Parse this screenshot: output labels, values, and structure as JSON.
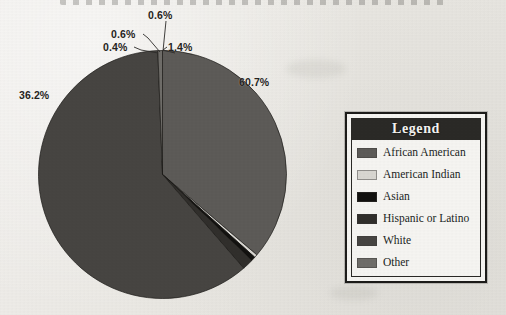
{
  "chart_data": {
    "type": "pie",
    "title": "",
    "categories": [
      "African American",
      "American Indian",
      "Asian",
      "Hispanic or Latino",
      "White",
      "Other"
    ],
    "values": [
      36.2,
      0.4,
      0.6,
      1.4,
      60.7,
      0.6
    ],
    "value_labels": [
      "36.2%",
      "0.4%",
      "0.6%",
      "1.4%",
      "60.7%",
      "0.6%"
    ],
    "unit": "percent",
    "legend_position": "right",
    "legend_title": "Legend",
    "grid": false,
    "colors": [
      "#5d5b58",
      "#d8d6d1",
      "#131210",
      "#312f2c",
      "#474542",
      "#6f6d69"
    ],
    "series": [
      {
        "name": "Race and Ethnicity Distribution",
        "slices": [
          {
            "label": "African American",
            "value": 36.2,
            "display": "36.2%",
            "color": "#5d5b58"
          },
          {
            "label": "American Indian",
            "value": 0.4,
            "display": "0.4%",
            "color": "#d8d6d1"
          },
          {
            "label": "Asian",
            "value": 0.6,
            "display": "0.6%",
            "color": "#131210"
          },
          {
            "label": "Hispanic or Latino",
            "value": 1.4,
            "display": "1.4%",
            "color": "#312f2c"
          },
          {
            "label": "White",
            "value": 60.7,
            "display": "60.7%",
            "color": "#474542"
          },
          {
            "label": "Other",
            "value": 0.6,
            "display": "0.6%",
            "color": "#6f6d69"
          }
        ]
      }
    ]
  },
  "callouts": [
    {
      "id": "c0",
      "text": "0.6%"
    },
    {
      "id": "c1",
      "text": "0.6%"
    },
    {
      "id": "c2",
      "text": "0.4%"
    },
    {
      "id": "c3",
      "text": "1.4%"
    },
    {
      "id": "c4",
      "text": "60.7%"
    },
    {
      "id": "c5",
      "text": "36.2%"
    }
  ],
  "legend": {
    "title": "Legend",
    "items": [
      {
        "label": "African American",
        "color": "#5d5b58"
      },
      {
        "label": "American Indian",
        "color": "#d8d6d1"
      },
      {
        "label": "Asian",
        "color": "#131210"
      },
      {
        "label": "Hispanic or Latino",
        "color": "#312f2c"
      },
      {
        "label": "White",
        "color": "#474542"
      },
      {
        "label": "Other",
        "color": "#6f6d69"
      }
    ]
  },
  "style": {
    "background": "#eceae6",
    "text_color": "#211f1d",
    "legend_header_bg": "#2b2a27",
    "legend_header_text": "#f4f3f0"
  }
}
